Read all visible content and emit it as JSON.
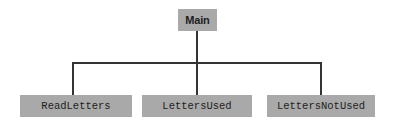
{
  "diagram": {
    "type": "tree",
    "root": {
      "label": "Main"
    },
    "children": [
      {
        "label": "ReadLetters"
      },
      {
        "label": "LettersUsed"
      },
      {
        "label": "LettersNotUsed"
      }
    ],
    "colors": {
      "node_fill": "#a9a9a9",
      "line": "#333333",
      "text": "#1e1e1e",
      "background": "#ffffff"
    }
  }
}
